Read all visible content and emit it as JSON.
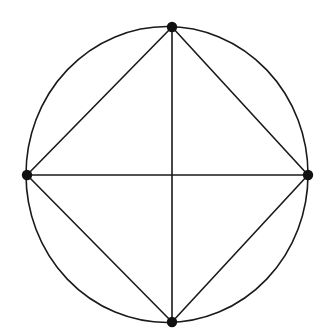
{
  "figure": {
    "canvas": {
      "width": 327,
      "height": 336
    },
    "background_color": "#ffffff",
    "stroke_color": "#1a1a1a",
    "vertex_color": "#111111",
    "stroke_width": 1.6,
    "vertex_radius": 5.2,
    "circle": {
      "name": "circumscribed-circle",
      "cx": 167,
      "cy": 174.5,
      "rx": 141,
      "ry": 148
    },
    "vertices": [
      {
        "name": "vertex-top",
        "label": "top",
        "x": 172,
        "y": 27
      },
      {
        "name": "vertex-right",
        "label": "right",
        "x": 308,
        "y": 175
      },
      {
        "name": "vertex-bottom",
        "label": "bottom",
        "x": 172,
        "y": 322
      },
      {
        "name": "vertex-left",
        "label": "left",
        "x": 27,
        "y": 175
      }
    ],
    "edges": [
      {
        "name": "chord-top-right",
        "from": "top",
        "to": "right",
        "x1": 172,
        "y1": 27,
        "x2": 308,
        "y2": 175,
        "kind": "chord"
      },
      {
        "name": "chord-right-bottom",
        "from": "right",
        "to": "bottom",
        "x1": 308,
        "y1": 175,
        "x2": 172,
        "y2": 322,
        "kind": "chord"
      },
      {
        "name": "chord-bottom-left",
        "from": "bottom",
        "to": "left",
        "x1": 172,
        "y1": 322,
        "x2": 27,
        "y2": 175,
        "kind": "chord"
      },
      {
        "name": "chord-left-top",
        "from": "left",
        "to": "top",
        "x1": 27,
        "y1": 175,
        "x2": 172,
        "y2": 27,
        "kind": "chord"
      },
      {
        "name": "diameter-horizontal",
        "from": "left",
        "to": "right",
        "x1": 27,
        "y1": 175,
        "x2": 308,
        "y2": 175,
        "kind": "diameter"
      },
      {
        "name": "diameter-vertical",
        "from": "top",
        "to": "bottom",
        "x1": 172,
        "y1": 27,
        "x2": 172,
        "y2": 322,
        "kind": "diameter"
      }
    ],
    "counts": {
      "vertices": 4,
      "chords": 4,
      "diameters": 2,
      "regions": 4
    }
  }
}
